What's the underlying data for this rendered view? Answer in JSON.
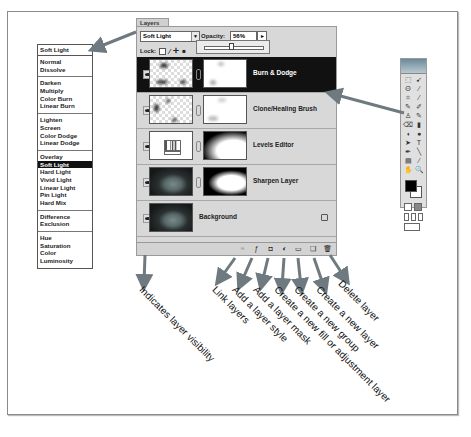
{
  "blend_menu": {
    "current": "Soft Light",
    "groups": [
      [
        "Normal",
        "Dissolve"
      ],
      [
        "Darken",
        "Multiply",
        "Color Burn",
        "Linear Burn"
      ],
      [
        "Lighten",
        "Screen",
        "Color Dodge",
        "Linear Dodge"
      ],
      [
        "Overlay",
        "Soft Light",
        "Hard Light",
        "Vivid Light",
        "Linear Light",
        "Pin Light",
        "Hard Mix"
      ],
      [
        "Difference",
        "Exclusion"
      ],
      [
        "Hue",
        "Saturation",
        "Color",
        "Luminosity"
      ]
    ],
    "selected": "Soft Light"
  },
  "layers_panel": {
    "tab": "Layers",
    "blend_mode": "Soft Light",
    "opacity_label": "Opacity:",
    "opacity_value": "56%",
    "lock_label": "Lock:",
    "layers": [
      {
        "name": "Burn & Dodge",
        "active": true
      },
      {
        "name": "Clone/Healing Brush",
        "active": false
      },
      {
        "name": "Levels Editor",
        "active": false
      },
      {
        "name": "Sharpen Layer",
        "active": false
      },
      {
        "name": "Background",
        "active": false
      }
    ]
  },
  "annotations": {
    "visibility": "Indicates layer visibility",
    "link": "Link layers",
    "style": "Add a layer style",
    "mask": "Add a layer mask",
    "fill": "Create a new fill or adjustment layer",
    "group": "Create a new group",
    "new_layer": "Create a new layer",
    "delete": "Delete layer"
  },
  "colors": {
    "arrow": "#6f7a80",
    "active_layer": "#111111",
    "panel_bg": "#d8d8d8"
  }
}
